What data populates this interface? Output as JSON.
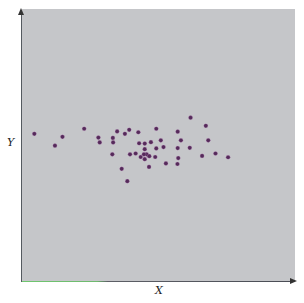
{
  "chart_data": {
    "type": "scatter",
    "title": "",
    "xlabel": "X",
    "ylabel": "Y",
    "grid": false,
    "legend": null,
    "xlim": [
      0,
      100
    ],
    "ylim": [
      0,
      100
    ],
    "x_ticks": [],
    "y_ticks": [],
    "point_color": "#552a5a",
    "background_color": "#c5c6c9",
    "series": [
      {
        "name": "points",
        "points": [
          {
            "x": 4.6,
            "y": 54.7
          },
          {
            "x": 12.3,
            "y": 50.3
          },
          {
            "x": 15.1,
            "y": 53.6
          },
          {
            "x": 23.2,
            "y": 56.6
          },
          {
            "x": 28.5,
            "y": 53.3
          },
          {
            "x": 29.0,
            "y": 51.5
          },
          {
            "x": 33.9,
            "y": 53.2
          },
          {
            "x": 34.0,
            "y": 51.5
          },
          {
            "x": 33.7,
            "y": 47.1
          },
          {
            "x": 35.5,
            "y": 55.6
          },
          {
            "x": 38.4,
            "y": 54.7
          },
          {
            "x": 40.0,
            "y": 56.2
          },
          {
            "x": 43.4,
            "y": 55.3
          },
          {
            "x": 43.7,
            "y": 51.2
          },
          {
            "x": 45.8,
            "y": 51.1
          },
          {
            "x": 45.8,
            "y": 49.0
          },
          {
            "x": 48.1,
            "y": 51.6
          },
          {
            "x": 50.1,
            "y": 56.6
          },
          {
            "x": 51.8,
            "y": 52.3
          },
          {
            "x": 52.8,
            "y": 49.8
          },
          {
            "x": 50.1,
            "y": 49.3
          },
          {
            "x": 40.3,
            "y": 47.1
          },
          {
            "x": 42.4,
            "y": 47.4
          },
          {
            "x": 44.3,
            "y": 46.1
          },
          {
            "x": 45.8,
            "y": 45.3
          },
          {
            "x": 46.5,
            "y": 47.1
          },
          {
            "x": 47.5,
            "y": 46.4
          },
          {
            "x": 49.7,
            "y": 46.1
          },
          {
            "x": 47.4,
            "y": 42.4
          },
          {
            "x": 37.2,
            "y": 41.7
          },
          {
            "x": 39.3,
            "y": 37.1
          },
          {
            "x": 53.7,
            "y": 43.7
          },
          {
            "x": 58.1,
            "y": 55.5
          },
          {
            "x": 59.3,
            "y": 52.3
          },
          {
            "x": 58.1,
            "y": 49.4
          },
          {
            "x": 58.3,
            "y": 45.7
          },
          {
            "x": 58.0,
            "y": 43.5
          },
          {
            "x": 62.9,
            "y": 60.7
          },
          {
            "x": 62.6,
            "y": 49.5
          },
          {
            "x": 68.6,
            "y": 57.7
          },
          {
            "x": 69.5,
            "y": 52.3
          },
          {
            "x": 67.2,
            "y": 46.5
          },
          {
            "x": 72.2,
            "y": 47.4
          },
          {
            "x": 76.9,
            "y": 46.0
          },
          {
            "x": 45.5,
            "y": 47.1
          }
        ]
      }
    ]
  }
}
